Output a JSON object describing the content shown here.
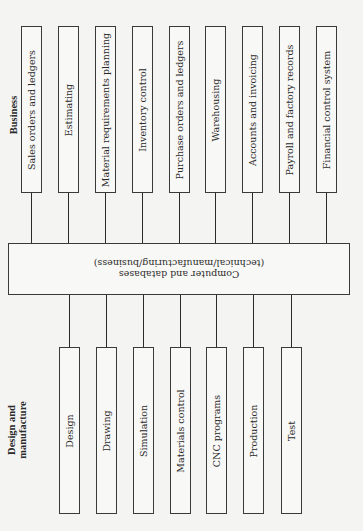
{
  "diagram": {
    "business_label": "Business",
    "design_label_line1": "Design and",
    "design_label_line2": "manufacture",
    "center": {
      "line1": "Computer and databases",
      "line2": "(technical/manufacturing/business)"
    },
    "business_items": [
      {
        "label": "Sales orders and ledgers",
        "x": 21
      },
      {
        "label": "Estimating",
        "x": 58
      },
      {
        "label": "Material requirements planning",
        "x": 95
      },
      {
        "label": "Inventory control",
        "x": 132
      },
      {
        "label": "Purchase orders and ledgers",
        "x": 169
      },
      {
        "label": "Warehousing",
        "x": 205
      },
      {
        "label": "Accounts and invoicing",
        "x": 242
      },
      {
        "label": "Payroll and factory records",
        "x": 279
      },
      {
        "label": "Financial control system",
        "x": 316
      }
    ],
    "design_items": [
      {
        "label": "Design",
        "x": 59
      },
      {
        "label": "Drawing",
        "x": 96
      },
      {
        "label": "Simulation",
        "x": 133
      },
      {
        "label": "Materials control",
        "x": 170
      },
      {
        "label": "CNC programs",
        "x": 206
      },
      {
        "label": "Production",
        "x": 243
      },
      {
        "label": "Test",
        "x": 281
      }
    ]
  }
}
